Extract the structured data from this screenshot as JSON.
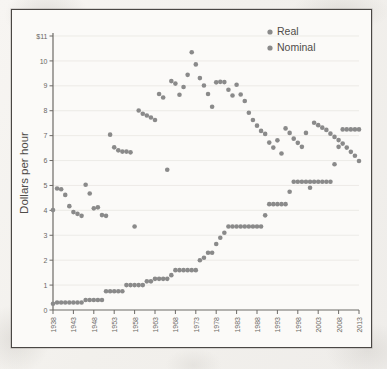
{
  "figure": {
    "dot_color": "#8a8a8a",
    "axis_color": "#6d6a66",
    "text_color": "#56534f",
    "paper_color": "#fbfaf8"
  },
  "axes": {
    "y_title": "Dollars per hour",
    "x_title": "Year",
    "y_ticks": [
      "$11",
      "10",
      "9",
      "8",
      "7",
      "6",
      "5",
      "4",
      "3",
      "2",
      "1",
      "0"
    ],
    "x_ticks": [
      "1938",
      "1943",
      "1948",
      "1953",
      "1958",
      "1963",
      "1968",
      "1973",
      "1978",
      "1983",
      "1988",
      "1993",
      "1998",
      "2003",
      "2008",
      "2013"
    ]
  },
  "legend": {
    "position": "top-right",
    "items": [
      {
        "label": "Real",
        "color": "#8a8a8a"
      },
      {
        "label": "Nominal",
        "color": "#8a8a8a"
      }
    ]
  },
  "chart_data": {
    "type": "scatter",
    "title": "",
    "subtitle": "",
    "xlabel": "Year",
    "ylabel": "Dollars per hour",
    "xlim": [
      1938,
      2013
    ],
    "ylim": [
      0,
      11
    ],
    "grid": true,
    "legend_position": "top-right",
    "x": [
      1938,
      1939,
      1940,
      1941,
      1942,
      1943,
      1944,
      1945,
      1946,
      1947,
      1948,
      1949,
      1950,
      1951,
      1952,
      1953,
      1954,
      1955,
      1956,
      1957,
      1958,
      1959,
      1960,
      1961,
      1962,
      1963,
      1964,
      1965,
      1966,
      1967,
      1968,
      1969,
      1970,
      1971,
      1972,
      1973,
      1974,
      1975,
      1976,
      1977,
      1978,
      1979,
      1980,
      1981,
      1982,
      1983,
      1984,
      1985,
      1986,
      1987,
      1988,
      1989,
      1990,
      1991,
      1992,
      1993,
      1994,
      1995,
      1996,
      1997,
      1998,
      1999,
      2000,
      2001,
      2002,
      2003,
      2004,
      2005,
      2006,
      2007,
      2008,
      2009,
      2010,
      2011,
      2012,
      2013
    ],
    "series": [
      {
        "name": "Real",
        "color": "#8a8a8a",
        "values": [
          4.01,
          4.88,
          4.85,
          4.62,
          4.17,
          3.93,
          3.86,
          3.78,
          5.03,
          4.68,
          4.08,
          4.12,
          3.81,
          3.78,
          7.04,
          6.53,
          6.41,
          6.36,
          6.36,
          6.33,
          3.35,
          8.01,
          7.88,
          7.81,
          7.73,
          7.63,
          8.67,
          8.53,
          5.63,
          9.19,
          9.09,
          8.64,
          8.95,
          9.44,
          10.35,
          9.86,
          9.31,
          9.01,
          8.67,
          8.16,
          9.14,
          9.16,
          9.15,
          8.84,
          8.61,
          9.04,
          8.65,
          8.39,
          7.92,
          7.63,
          7.4,
          7.19,
          7.07,
          6.72,
          6.52,
          6.81,
          6.28,
          7.29,
          7.11,
          6.88,
          6.71,
          6.55,
          7.11,
          4.91,
          7.52,
          7.42,
          7.32,
          7.23,
          7.08,
          6.95,
          6.82,
          6.68,
          6.52,
          6.35,
          6.19,
          5.98
        ]
      },
      {
        "name": "Nominal",
        "color": "#8a8a8a",
        "values": [
          0.25,
          0.3,
          0.3,
          0.3,
          0.3,
          0.3,
          0.3,
          0.3,
          0.4,
          0.4,
          0.4,
          0.4,
          0.4,
          0.75,
          0.75,
          0.75,
          0.75,
          0.75,
          1.0,
          1.0,
          1.0,
          1.0,
          1.0,
          1.15,
          1.15,
          1.25,
          1.25,
          1.25,
          1.25,
          1.4,
          1.6,
          1.6,
          1.6,
          1.6,
          1.6,
          1.6,
          2.0,
          2.1,
          2.3,
          2.3,
          2.65,
          2.9,
          3.1,
          3.35,
          3.35,
          3.35,
          3.35,
          3.35,
          3.35,
          3.35,
          3.35,
          3.35,
          3.8,
          4.25,
          4.25,
          4.25,
          4.25,
          4.25,
          4.75,
          5.15,
          5.15,
          5.15,
          5.15,
          5.15,
          5.15,
          5.15,
          5.15,
          5.15,
          5.15,
          5.85,
          6.55,
          7.25,
          7.25,
          7.25,
          7.25,
          7.25
        ]
      }
    ]
  }
}
